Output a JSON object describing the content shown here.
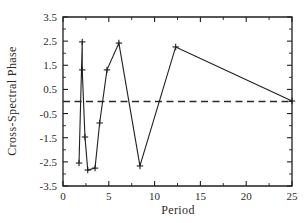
{
  "chart_data": {
    "type": "line",
    "title": "",
    "xlabel": "Period",
    "ylabel": "Cross-Spectral  Phase",
    "xlim": [
      0,
      25
    ],
    "ylim": [
      -3.5,
      3.5
    ],
    "grid": false,
    "legend": null,
    "x_ticks": [
      0,
      5,
      10,
      15,
      20,
      25
    ],
    "x_tick_labels": [
      "0",
      "5",
      "10",
      "15",
      "20",
      "25"
    ],
    "x_minor_tick_interval": 2.5,
    "y_ticks": [
      -3.5,
      -2.5,
      -1.5,
      -0.5,
      0.5,
      1.5,
      2.5,
      3.5
    ],
    "y_tick_labels": [
      "-3.5",
      "-2.5",
      "-1.5",
      "-0.5",
      "0.5",
      "1.5",
      "2.5",
      "3.5"
    ],
    "y_minor_tick_interval": 0.5,
    "marker_style": "plus",
    "line_color": "#1f1f1f",
    "annotations": [
      {
        "kind": "reference-line",
        "orientation": "horizontal",
        "value": 0,
        "style": "dashed",
        "color": "#2a2a2a"
      }
    ],
    "series": [
      {
        "name": "Cross-Spectral Phase",
        "x": [
          1.75,
          2.1,
          2.1,
          2.4,
          2.7,
          3.5,
          4.0,
          4.8,
          6.1,
          8.4,
          12.3,
          25.0
        ],
        "y": [
          -2.55,
          2.47,
          1.31,
          -1.47,
          -2.84,
          -2.76,
          -0.89,
          1.31,
          2.42,
          -2.67,
          2.26,
          0.02
        ]
      }
    ]
  }
}
